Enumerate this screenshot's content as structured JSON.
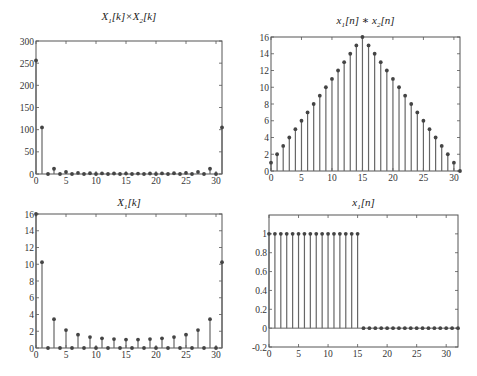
{
  "figure": {
    "layout": "2x2 subplots",
    "colors": {
      "stem": "#666666",
      "marker": "#444444",
      "axis": "#555555",
      "background": "#ffffff"
    }
  },
  "chart_data": [
    {
      "id": "top-left",
      "type": "stem",
      "title": "X1[k]×X2[k]",
      "title_parts": {
        "a": "X",
        "a_sub": "1",
        "mid": "[k]×X",
        "b_sub": "2",
        "end": "[k]"
      },
      "xlabel": "",
      "ylabel": "",
      "xlim": [
        0,
        31
      ],
      "ylim": [
        0,
        300
      ],
      "xticks": [
        0,
        5,
        10,
        15,
        20,
        25,
        30
      ],
      "yticks": [
        0,
        50,
        100,
        150,
        200,
        250,
        300
      ],
      "grid": false,
      "x": [
        0,
        1,
        2,
        3,
        4,
        5,
        6,
        7,
        8,
        9,
        10,
        11,
        12,
        13,
        14,
        15,
        16,
        17,
        18,
        19,
        20,
        21,
        22,
        23,
        24,
        25,
        26,
        27,
        28,
        29,
        30,
        31
      ],
      "values": [
        256,
        105.1,
        0,
        11.8,
        0,
        4.6,
        0,
        2.5,
        0,
        1.7,
        0,
        1.3,
        0,
        1.1,
        0,
        1.0,
        0,
        1.0,
        0,
        1.1,
        0,
        1.3,
        0,
        1.7,
        0,
        2.5,
        0,
        4.6,
        0,
        11.8,
        0,
        105.1
      ]
    },
    {
      "id": "top-right",
      "type": "stem",
      "title": "x1[n] * x2[n]",
      "title_parts": {
        "a": "x",
        "a_sub": "1",
        "mid": "[n] ∗ x",
        "b_sub": "2",
        "end": "[n]"
      },
      "xlabel": "",
      "ylabel": "",
      "xlim": [
        0,
        31
      ],
      "ylim": [
        0,
        16
      ],
      "xticks": [
        0,
        5,
        10,
        15,
        20,
        25,
        30
      ],
      "yticks": [
        0,
        2,
        4,
        6,
        8,
        10,
        12,
        14,
        16
      ],
      "grid": false,
      "x": [
        0,
        1,
        2,
        3,
        4,
        5,
        6,
        7,
        8,
        9,
        10,
        11,
        12,
        13,
        14,
        15,
        16,
        17,
        18,
        19,
        20,
        21,
        22,
        23,
        24,
        25,
        26,
        27,
        28,
        29,
        30,
        31
      ],
      "values": [
        1,
        2,
        3,
        4,
        5,
        6,
        7,
        8,
        9,
        10,
        11,
        12,
        13,
        14,
        15,
        16,
        15,
        14,
        13,
        12,
        11,
        10,
        9,
        8,
        7,
        6,
        5,
        4,
        3,
        2,
        1,
        0
      ]
    },
    {
      "id": "bottom-left",
      "type": "stem",
      "title": "X1[k]",
      "title_parts": {
        "a": "X",
        "a_sub": "1",
        "mid": "[k]",
        "b_sub": "",
        "end": ""
      },
      "xlabel": "",
      "ylabel": "",
      "xlim": [
        0,
        31
      ],
      "ylim": [
        0,
        16
      ],
      "xticks": [
        0,
        5,
        10,
        15,
        20,
        25,
        30
      ],
      "yticks": [
        0,
        2,
        4,
        6,
        8,
        10,
        12,
        14,
        16
      ],
      "grid": false,
      "x": [
        0,
        1,
        2,
        3,
        4,
        5,
        6,
        7,
        8,
        9,
        10,
        11,
        12,
        13,
        14,
        15,
        16,
        17,
        18,
        19,
        20,
        21,
        22,
        23,
        24,
        25,
        26,
        27,
        28,
        29,
        30,
        31
      ],
      "values": [
        16,
        10.25,
        0,
        3.44,
        0,
        2.14,
        0,
        1.59,
        0,
        1.31,
        0,
        1.15,
        0,
        1.06,
        0,
        1.01,
        0,
        1.01,
        0,
        1.06,
        0,
        1.15,
        0,
        1.31,
        0,
        1.59,
        0,
        2.14,
        0,
        3.44,
        0,
        10.25
      ]
    },
    {
      "id": "bottom-right",
      "type": "stem",
      "title": "x1[n]",
      "title_parts": {
        "a": "x",
        "a_sub": "1",
        "mid": "[n]",
        "b_sub": "",
        "end": ""
      },
      "xlabel": "",
      "ylabel": "",
      "xlim": [
        0,
        32
      ],
      "ylim": [
        -0.2,
        1.2
      ],
      "xticks": [
        0,
        5,
        10,
        15,
        20,
        25,
        30
      ],
      "yticks": [
        -0.2,
        0,
        0.2,
        0.4,
        0.6,
        0.8,
        1
      ],
      "ytick_labels": [
        "-0.2",
        "0",
        "0.2",
        "0.4",
        "0.6",
        "0.8",
        "1"
      ],
      "grid": false,
      "x": [
        0,
        1,
        2,
        3,
        4,
        5,
        6,
        7,
        8,
        9,
        10,
        11,
        12,
        13,
        14,
        15,
        16,
        17,
        18,
        19,
        20,
        21,
        22,
        23,
        24,
        25,
        26,
        27,
        28,
        29,
        30,
        31,
        32
      ],
      "values": [
        1,
        1,
        1,
        1,
        1,
        1,
        1,
        1,
        1,
        1,
        1,
        1,
        1,
        1,
        1,
        1,
        0,
        0,
        0,
        0,
        0,
        0,
        0,
        0,
        0,
        0,
        0,
        0,
        0,
        0,
        0,
        0,
        0
      ]
    }
  ],
  "panel_boxes": [
    {
      "left": 36,
      "top": 41,
      "right": 222,
      "bottom": 174,
      "title_y": 10
    },
    {
      "left": 271,
      "top": 37,
      "right": 460,
      "bottom": 171,
      "title_y": 14
    },
    {
      "left": 36,
      "top": 214,
      "right": 222,
      "bottom": 348,
      "title_y": 196
    },
    {
      "left": 269,
      "top": 215,
      "right": 458,
      "bottom": 347,
      "title_y": 196
    }
  ]
}
